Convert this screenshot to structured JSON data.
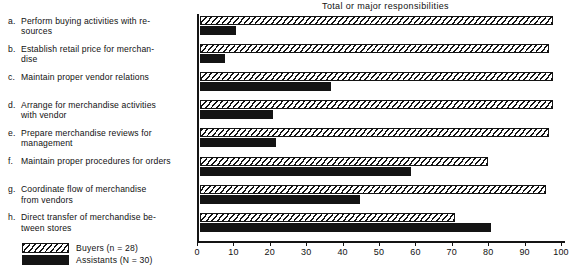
{
  "chart_data": {
    "type": "bar",
    "orientation": "horizontal",
    "title": "Total or major responsibilities",
    "xlabel": "",
    "ylabel": "",
    "xlim": [
      0,
      100
    ],
    "xticks": [
      0,
      10,
      20,
      30,
      40,
      50,
      60,
      70,
      80,
      90,
      100
    ],
    "xtick_labels": [
      "0",
      "10",
      "20",
      "30",
      "40",
      "50",
      "60",
      "70",
      "80",
      "90",
      "100"
    ],
    "grid": false,
    "legend_position": "bottom-left",
    "categories": [
      "Perform buying activities with re-sources",
      "Establish retail price for merchan-dise",
      "Maintain proper vendor relations",
      "Arrange for merchandise activities with vendor",
      "Prepare merchandise reviews for management",
      "Maintain proper procedures for orders",
      "Coordinate flow of merchandise from vendors",
      "Direct transfer of merchandise be-tween stores"
    ],
    "category_letters": [
      "a.",
      "b.",
      "c.",
      "d.",
      "e.",
      "f.",
      "g.",
      "h."
    ],
    "category_lines": [
      [
        "Perform buying activities with re-",
        "sources"
      ],
      [
        "Establish retail price for merchan-",
        "dise"
      ],
      [
        "Maintain proper vendor relations"
      ],
      [
        "Arrange for merchandise activities",
        "with vendor"
      ],
      [
        "Prepare merchandise reviews for",
        "management"
      ],
      [
        "Maintain proper procedures for orders"
      ],
      [
        "Coordinate flow of merchandise",
        "from vendors"
      ],
      [
        "Direct transfer of merchandise be-",
        "tween stores"
      ]
    ],
    "series": [
      {
        "name": "Buyers (n = 28)",
        "pattern": "diagonal-hatch",
        "color": "#141414",
        "values": [
          97,
          96,
          97,
          97,
          96,
          79,
          95,
          70
        ]
      },
      {
        "name": "Assistants (N = 30)",
        "pattern": "solid",
        "color": "#141414",
        "values": [
          10,
          7,
          36,
          20,
          21,
          58,
          44,
          80
        ]
      }
    ]
  },
  "legend": {
    "entries": [
      {
        "label": "Buyers (n = 28)",
        "swatch": "hatch"
      },
      {
        "label": "Assistants (N = 30)",
        "swatch": "solid"
      }
    ]
  }
}
